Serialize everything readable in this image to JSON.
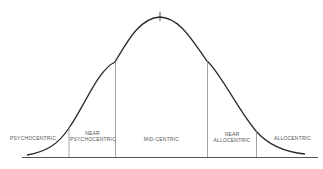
{
  "diagram": {
    "type": "normal-distribution-curve",
    "colors": {
      "background": "#ffffff",
      "curve": "#2a2a2a",
      "lines": "#8a8a8a",
      "text": "#555555"
    },
    "segments": [
      {
        "id": "psychocentric",
        "line1": "",
        "line2": "PSYCHOCENTRIC"
      },
      {
        "id": "near-psychocentric",
        "line1": "NEAR",
        "line2": "PSYCHOCENTRIC"
      },
      {
        "id": "midcentric",
        "line1": "",
        "line2": "MID-CENTRIC"
      },
      {
        "id": "near-allocentric",
        "line1": "NEAR",
        "line2": "ALLOCENTRIC"
      },
      {
        "id": "allocentric",
        "line1": "",
        "line2": "ALLOCENTRIC"
      }
    ]
  }
}
